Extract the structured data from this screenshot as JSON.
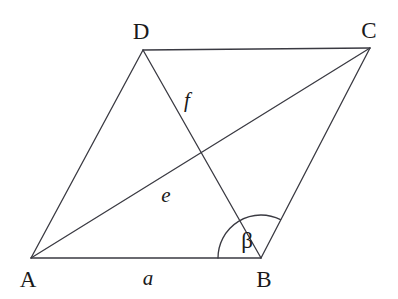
{
  "figure": {
    "type": "parallelogram-with-diagonals",
    "width": 398,
    "height": 299,
    "background_color": "#ffffff",
    "stroke_color": "#3a3a42",
    "stroke_width": 1.3
  },
  "vertices": [
    {
      "name": "A",
      "label": "A",
      "x": 31,
      "y": 258,
      "label_x": 28,
      "label_y": 279
    },
    {
      "name": "B",
      "label": "B",
      "x": 261,
      "y": 258,
      "label_x": 264,
      "label_y": 279
    },
    {
      "name": "C",
      "label": "C",
      "x": 370,
      "y": 48,
      "label_x": 369,
      "label_y": 30
    },
    {
      "name": "D",
      "label": "D",
      "x": 143,
      "y": 50,
      "label_x": 141,
      "label_y": 31
    }
  ],
  "edges": [
    {
      "name": "side-AB",
      "from": "A",
      "to": "B",
      "label": "a",
      "label_x": 148,
      "label_y": 278
    },
    {
      "name": "side-BC",
      "from": "B",
      "to": "C",
      "label": "",
      "label_x": 0,
      "label_y": 0
    },
    {
      "name": "side-CD",
      "from": "C",
      "to": "D",
      "label": "",
      "label_x": 0,
      "label_y": 0
    },
    {
      "name": "side-DA",
      "from": "D",
      "to": "A",
      "label": "",
      "label_x": 0,
      "label_y": 0
    }
  ],
  "diagonals": [
    {
      "name": "diagonal-AC",
      "from": "A",
      "to": "C",
      "label": "e",
      "label_x": 166,
      "label_y": 195
    },
    {
      "name": "diagonal-DB",
      "from": "D",
      "to": "B",
      "label": "f",
      "label_x": 187,
      "label_y": 100
    }
  ],
  "angles": [
    {
      "name": "angle-beta",
      "label": "β",
      "at_vertex": "B",
      "label_x": 247,
      "label_y": 240,
      "radius": 43,
      "start_deg": 180,
      "end_deg": 297
    }
  ],
  "intersection": {
    "name": "diagonal-intersection",
    "x": 200,
    "y": 153
  }
}
